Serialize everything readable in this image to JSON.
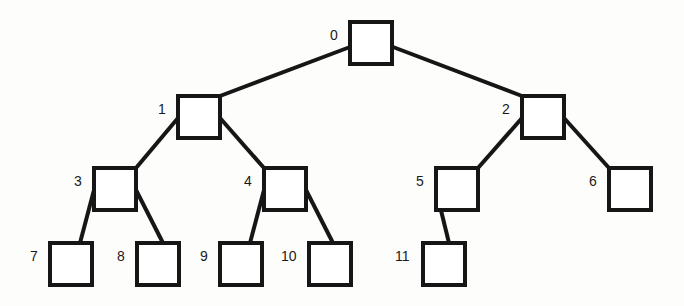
{
  "diagram": {
    "kind": "binary-tree",
    "title": "",
    "node_size": 46,
    "border_width": 4,
    "colors": {
      "background": "#fdfdfc",
      "node_fill": "#ffffff",
      "node_stroke": "#161616",
      "edge_stroke": "#161616",
      "label_color": "#1a1a1a"
    },
    "nodes": [
      {
        "id": "0",
        "label": "0",
        "x": 348,
        "y": 20,
        "label_x": 330,
        "label_y": 28
      },
      {
        "id": "1",
        "label": "1",
        "x": 176,
        "y": 94,
        "label_x": 158,
        "label_y": 102
      },
      {
        "id": "2",
        "label": "2",
        "x": 520,
        "y": 94,
        "label_x": 502,
        "label_y": 102
      },
      {
        "id": "3",
        "label": "3",
        "x": 92,
        "y": 166,
        "label_x": 74,
        "label_y": 174
      },
      {
        "id": "4",
        "label": "4",
        "x": 262,
        "y": 166,
        "label_x": 244,
        "label_y": 174
      },
      {
        "id": "5",
        "label": "5",
        "x": 434,
        "y": 166,
        "label_x": 416,
        "label_y": 174
      },
      {
        "id": "6",
        "label": "6",
        "x": 607,
        "y": 166,
        "label_x": 589,
        "label_y": 174
      },
      {
        "id": "7",
        "label": "7",
        "x": 48,
        "y": 241,
        "label_x": 30,
        "label_y": 249
      },
      {
        "id": "8",
        "label": "8",
        "x": 135,
        "y": 241,
        "label_x": 117,
        "label_y": 249
      },
      {
        "id": "9",
        "label": "9",
        "x": 218,
        "y": 241,
        "label_x": 200,
        "label_y": 249
      },
      {
        "id": "10",
        "label": "10",
        "x": 307,
        "y": 241,
        "label_x": 281,
        "label_y": 249
      },
      {
        "id": "11",
        "label": "11",
        "x": 421,
        "y": 241,
        "label_x": 395,
        "label_y": 249
      }
    ],
    "edges": [
      {
        "from": "0",
        "to": "1",
        "x1": 350,
        "y1": 47,
        "x2": 220,
        "y2": 96
      },
      {
        "from": "0",
        "to": "2",
        "x1": 393,
        "y1": 47,
        "x2": 522,
        "y2": 96
      },
      {
        "from": "1",
        "to": "3",
        "x1": 178,
        "y1": 118,
        "x2": 136,
        "y2": 168
      },
      {
        "from": "1",
        "to": "4",
        "x1": 220,
        "y1": 118,
        "x2": 264,
        "y2": 168
      },
      {
        "from": "2",
        "to": "5",
        "x1": 522,
        "y1": 118,
        "x2": 478,
        "y2": 168
      },
      {
        "from": "2",
        "to": "6",
        "x1": 564,
        "y1": 118,
        "x2": 609,
        "y2": 168
      },
      {
        "from": "3",
        "to": "7",
        "x1": 94,
        "y1": 190,
        "x2": 80,
        "y2": 243
      },
      {
        "from": "3",
        "to": "8",
        "x1": 136,
        "y1": 190,
        "x2": 163,
        "y2": 243
      },
      {
        "from": "4",
        "to": "9",
        "x1": 264,
        "y1": 190,
        "x2": 250,
        "y2": 243
      },
      {
        "from": "4",
        "to": "10",
        "x1": 306,
        "y1": 190,
        "x2": 333,
        "y2": 243
      },
      {
        "from": "5",
        "to": "11",
        "x1": 436,
        "y1": 190,
        "x2": 449,
        "y2": 243
      }
    ]
  }
}
